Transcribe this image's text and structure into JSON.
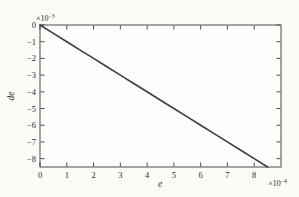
{
  "figure": {
    "background": "#fbfbf8",
    "plot_background": "#fdfdfc",
    "axis_color": "#4a4a4a",
    "text_color": "#2b2b2b"
  },
  "chart_data": {
    "type": "line",
    "title": "",
    "xlabel": "e",
    "ylabel": "de",
    "x_axis_multiplier": {
      "base": "×10",
      "exponent": "−4"
    },
    "y_axis_multiplier": {
      "base": "×10",
      "exponent": "−3"
    },
    "xlim": [
      0,
      0.0009
    ],
    "ylim": [
      -0.0085,
      0
    ],
    "grid": false,
    "box": true,
    "line_color": "#3f3f3f",
    "x_ticks": [
      0,
      0.0001,
      0.0002,
      0.0003,
      0.0004,
      0.0005,
      0.0006,
      0.0007,
      0.0008
    ],
    "x_tick_labels": [
      "0",
      "1",
      "2",
      "3",
      "4",
      "5",
      "6",
      "7",
      "8"
    ],
    "y_ticks": [
      0,
      -0.001,
      -0.002,
      -0.003,
      -0.004,
      -0.005,
      -0.006,
      -0.007,
      -0.008
    ],
    "y_tick_labels": [
      "0",
      "−1",
      "−2",
      "−3",
      "−4",
      "−5",
      "−6",
      "−7",
      "−8"
    ],
    "series": [
      {
        "name": "de vs e",
        "x": [
          0,
          5e-05,
          0.0001,
          0.00015,
          0.0002,
          0.00025,
          0.0003,
          0.00035,
          0.0004,
          0.00045,
          0.0005,
          0.00055,
          0.0006,
          0.00065,
          0.0007,
          0.00075,
          0.0008,
          0.00085
        ],
        "y": [
          0,
          -0.0005,
          -0.001,
          -0.0015,
          -0.002,
          -0.0025,
          -0.003,
          -0.0035,
          -0.004,
          -0.0045,
          -0.005,
          -0.0055,
          -0.006,
          -0.0065,
          -0.007,
          -0.0075,
          -0.008,
          -0.0085
        ]
      }
    ]
  }
}
